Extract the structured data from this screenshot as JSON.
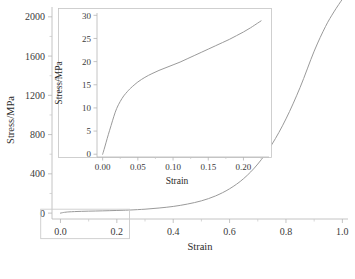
{
  "chart_data": [
    {
      "id": "main",
      "type": "line",
      "title": "",
      "xlabel": "Strain",
      "ylabel": "Stress/MPa",
      "xlim": [
        -0.03,
        1.02
      ],
      "ylim": [
        -60,
        2100
      ],
      "xticks": [
        0.0,
        0.2,
        0.4,
        0.6,
        0.8,
        1.0
      ],
      "xticklabels": [
        "0.0",
        "0.2",
        "0.4",
        "0.6",
        "0.8",
        "1.0"
      ],
      "yticks": [
        0,
        400,
        800,
        1200,
        1600,
        2000
      ],
      "yticklabels": [
        "0",
        "400",
        "800",
        "1200",
        "1600",
        "2000"
      ],
      "minor_xticks": [
        0.1,
        0.3,
        0.5,
        0.7,
        0.9
      ],
      "minor_yticks": [
        200,
        600,
        1000,
        1400,
        1800
      ],
      "grid": false,
      "legend": false,
      "line_color": "#9a9a9a",
      "series": [
        {
          "name": "stress-strain",
          "x": [
            0.0,
            0.005,
            0.01,
            0.02,
            0.03,
            0.05,
            0.075,
            0.1,
            0.125,
            0.15,
            0.175,
            0.2,
            0.225,
            0.25,
            0.3,
            0.35,
            0.4,
            0.45,
            0.5,
            0.55,
            0.6,
            0.65,
            0.7,
            0.75,
            0.8,
            0.85,
            0.9,
            0.94,
            0.97,
            1.0
          ],
          "y": [
            0,
            3,
            6,
            10,
            12.5,
            15.5,
            18,
            20,
            21.5,
            23,
            25,
            27,
            29,
            32,
            40,
            52,
            68,
            92,
            125,
            175,
            248,
            352,
            500,
            700,
            960,
            1280,
            1650,
            1900,
            2050,
            2180
          ]
        }
      ],
      "highlight_box": {
        "x0": -0.07,
        "x1": 0.245,
        "y0": -260,
        "y1": 40,
        "color": "#cccccc",
        "note": "zoom region rectangle around origin, expanded by inset"
      }
    },
    {
      "id": "inset",
      "type": "line",
      "title": "",
      "xlabel": "Strain",
      "ylabel": "Stress/MPa",
      "xlim": [
        -0.008,
        0.232
      ],
      "ylim": [
        -0.6,
        30.5
      ],
      "xticks": [
        0.0,
        0.05,
        0.1,
        0.15,
        0.2
      ],
      "xticklabels": [
        "0.00",
        "0.05",
        "0.10",
        "0.15",
        "0.20"
      ],
      "yticks": [
        0,
        5,
        10,
        15,
        20,
        25,
        30
      ],
      "yticklabels": [
        "0",
        "5",
        "10",
        "15",
        "20",
        "25",
        "30"
      ],
      "minor_xticks": [
        0.025,
        0.075,
        0.125,
        0.175,
        0.225
      ],
      "grid": false,
      "legend": false,
      "line_color": "#9a9a9a",
      "series": [
        {
          "name": "stress-strain-zoom",
          "x": [
            0.0,
            0.002,
            0.005,
            0.008,
            0.012,
            0.016,
            0.02,
            0.025,
            0.03,
            0.035,
            0.04,
            0.05,
            0.06,
            0.07,
            0.08,
            0.09,
            0.1,
            0.11,
            0.12,
            0.13,
            0.14,
            0.15,
            0.16,
            0.17,
            0.18,
            0.19,
            0.2,
            0.21,
            0.22,
            0.225
          ],
          "y": [
            0.0,
            1.0,
            2.6,
            4.2,
            6.2,
            8.2,
            9.9,
            11.4,
            12.6,
            13.5,
            14.3,
            15.6,
            16.6,
            17.4,
            18.1,
            18.7,
            19.3,
            19.9,
            20.6,
            21.3,
            22.0,
            22.7,
            23.4,
            24.1,
            24.8,
            25.6,
            26.4,
            27.3,
            28.3,
            28.8
          ]
        }
      ]
    }
  ],
  "main_axis": {
    "xlabel": "Strain",
    "ylabel": "Stress/MPa",
    "xticklabels": [
      "0.0",
      "0.2",
      "0.4",
      "0.6",
      "0.8",
      "1.0"
    ],
    "yticklabels": [
      "0",
      "400",
      "800",
      "1200",
      "1600",
      "2000"
    ]
  },
  "inset_axis": {
    "xlabel": "Strain",
    "ylabel": "Stress/MPa",
    "xticklabels": [
      "0.00",
      "0.05",
      "0.10",
      "0.15",
      "0.20"
    ],
    "yticklabels": [
      "0",
      "5",
      "10",
      "15",
      "20",
      "25",
      "30"
    ]
  },
  "style": {
    "curve_color": "#9a9a9a",
    "axis_color": "#b0b0b0",
    "text_color": "#3a3a3a",
    "background": "#ffffff"
  }
}
